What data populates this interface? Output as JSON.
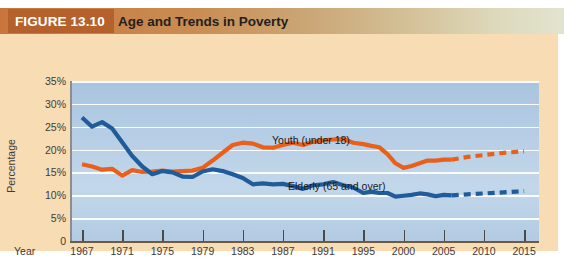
{
  "header": {
    "figure_tag": "FIGURE 13.10",
    "title": "Age and Trends in Poverty"
  },
  "axes": {
    "y_title": "Percentage",
    "x_title": "Year",
    "y_ticks": [
      "35%",
      "30%",
      "25%",
      "20%",
      "15%",
      "10%",
      "5%",
      "0"
    ],
    "x_ticks": [
      "1967",
      "1971",
      "1975",
      "1979",
      "1983",
      "1987",
      "1991",
      "1995",
      "2000",
      "2005",
      "2010",
      "2015"
    ]
  },
  "annotations": {
    "youth": "Youth (under 18)",
    "elderly": "Elderly (65 and over)"
  },
  "colors": {
    "youth_line": "#e8601c",
    "elderly_line": "#1f5c99",
    "plot_background": "#b9d0e6",
    "panel_background": "#f8dcb4",
    "band_start": "#c8763c",
    "tag_background": "#b5612c",
    "gridline": "#ffffff"
  },
  "chart_data": {
    "type": "line",
    "title": "Age and Trends in Poverty",
    "xlabel": "Year",
    "ylabel": "Percentage",
    "ylim": [
      0,
      35
    ],
    "grid": true,
    "legend_position": "inline-annotation",
    "x_tick_labels": [
      "1967",
      "1971",
      "1975",
      "1979",
      "1983",
      "1987",
      "1991",
      "1995",
      "2000",
      "2005",
      "2010",
      "2015"
    ],
    "projection_starts_year": 2006,
    "series": [
      {
        "name": "Youth (under 18)",
        "color": "#e8601c",
        "style": "solid-then-dashed",
        "x": [
          1967,
          1968,
          1969,
          1970,
          1971,
          1972,
          1973,
          1974,
          1975,
          1976,
          1977,
          1978,
          1979,
          1980,
          1981,
          1982,
          1983,
          1984,
          1985,
          1986,
          1987,
          1988,
          1989,
          1990,
          1991,
          1992,
          1993,
          1994,
          1995,
          1996,
          1997,
          1998,
          1999,
          2000,
          2001,
          2002,
          2003,
          2004,
          2005,
          2006
        ],
        "values": [
          16.8,
          16.3,
          15.6,
          15.8,
          14.3,
          15.5,
          15.1,
          15.2,
          15.4,
          15.2,
          15.3,
          15.4,
          16.0,
          17.6,
          19.3,
          21.0,
          21.5,
          21.3,
          20.5,
          20.4,
          21.0,
          21.5,
          21.0,
          21.7,
          22.0,
          22.2,
          22.3,
          21.5,
          21.2,
          20.8,
          20.5,
          19.0,
          17.0,
          16.0,
          16.4,
          17.0,
          17.6,
          17.6,
          17.8,
          17.8
        ]
      },
      {
        "name": "Youth (under 18) projected",
        "color": "#e8601c",
        "style": "dashed",
        "x": [
          2006,
          2008,
          2010,
          2012,
          2014,
          2015
        ],
        "values": [
          17.8,
          18.4,
          18.8,
          19.2,
          19.5,
          19.6
        ]
      },
      {
        "name": "Elderly (65 and over)",
        "color": "#1f5c99",
        "style": "solid-then-dashed",
        "x": [
          1967,
          1968,
          1969,
          1970,
          1971,
          1972,
          1973,
          1974,
          1975,
          1976,
          1977,
          1978,
          1979,
          1980,
          1981,
          1982,
          1983,
          1984,
          1985,
          1986,
          1987,
          1988,
          1989,
          1990,
          1991,
          1992,
          1993,
          1994,
          1995,
          1996,
          1997,
          1998,
          1999,
          2000,
          2001,
          2002,
          2003,
          2004,
          2005,
          2006
        ],
        "values": [
          27.0,
          25.0,
          26.0,
          24.6,
          21.6,
          18.6,
          16.3,
          14.6,
          15.3,
          15.0,
          14.1,
          14.0,
          15.2,
          15.7,
          15.3,
          14.6,
          13.8,
          12.4,
          12.6,
          12.4,
          12.5,
          12.0,
          11.4,
          12.2,
          12.4,
          12.9,
          12.2,
          11.7,
          10.5,
          10.8,
          10.5,
          10.5,
          9.7,
          9.9,
          10.1,
          10.4,
          10.2,
          9.8,
          10.1,
          10.0
        ]
      },
      {
        "name": "Elderly (65 and over) projected",
        "color": "#1f5c99",
        "style": "dashed",
        "x": [
          2006,
          2008,
          2010,
          2012,
          2014,
          2015
        ],
        "values": [
          10.0,
          10.2,
          10.4,
          10.6,
          10.8,
          10.9
        ]
      }
    ]
  }
}
